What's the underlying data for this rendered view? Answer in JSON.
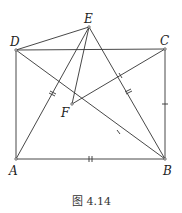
{
  "figure": {
    "caption": "图 4.14",
    "points": {
      "A": {
        "label": "A",
        "x": 16,
        "y": 159
      },
      "B": {
        "label": "B",
        "x": 165,
        "y": 159
      },
      "C": {
        "label": "C",
        "x": 165,
        "y": 49
      },
      "D": {
        "label": "D",
        "x": 16,
        "y": 50
      },
      "E": {
        "label": "E",
        "x": 89,
        "y": 27
      },
      "F": {
        "label": "F",
        "x": 72,
        "y": 104
      }
    },
    "segments": [
      "AB",
      "BC",
      "CD",
      "DA",
      "DE",
      "AE",
      "BE",
      "EF",
      "DB",
      "FC"
    ],
    "tick_marks": {
      "single": [
        "BC",
        "FC",
        "FB"
      ],
      "double": [
        "AB",
        "AE",
        "BE"
      ]
    },
    "colors": {
      "stroke": "#333333",
      "background": "#ffffff"
    }
  }
}
